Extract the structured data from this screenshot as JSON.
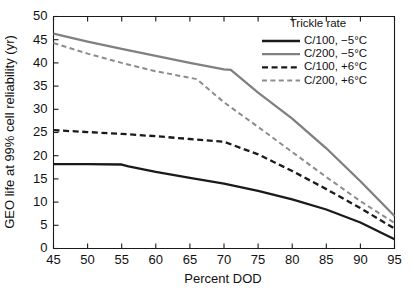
{
  "chart_data": {
    "type": "line",
    "title": "",
    "xlabel": "Percent DOD",
    "ylabel": "GEO life at 99% cell reliability (yr)",
    "xlim": [
      45,
      95
    ],
    "ylim": [
      0,
      50
    ],
    "xticks": [
      45,
      50,
      55,
      60,
      65,
      70,
      75,
      80,
      85,
      90,
      95
    ],
    "yticks": [
      0,
      5,
      10,
      15,
      20,
      25,
      30,
      35,
      40,
      45,
      50
    ],
    "grid": false,
    "legend_position": "upper-right-inside",
    "legend_title": "Trickle rate",
    "series": [
      {
        "name": "C/100, −5°C",
        "color": "#1a1a1a",
        "dash": "solid",
        "width": 2.3,
        "x": [
          45,
          50,
          55,
          56,
          60,
          65,
          70,
          75,
          80,
          85,
          90,
          95
        ],
        "values": [
          18.2,
          18.2,
          18.1,
          17.7,
          16.5,
          15.2,
          14.0,
          12.4,
          10.6,
          8.4,
          5.6,
          2.0
        ]
      },
      {
        "name": "C/200, −5°C",
        "color": "#808080",
        "dash": "solid",
        "width": 2.3,
        "x": [
          45,
          50,
          55,
          60,
          65,
          70,
          71,
          75,
          80,
          85,
          90,
          95
        ],
        "values": [
          46.3,
          44.6,
          43.0,
          41.5,
          40.0,
          38.6,
          38.5,
          33.6,
          28.0,
          21.6,
          14.5,
          7.0
        ]
      },
      {
        "name": "C/100, +6°C",
        "color": "#1a1a1a",
        "dash": "dashed",
        "width": 2.3,
        "x": [
          45,
          50,
          55,
          60,
          65,
          70,
          75,
          80,
          85,
          90,
          95
        ],
        "values": [
          25.5,
          25.1,
          24.7,
          24.2,
          23.6,
          23.0,
          20.3,
          16.7,
          12.8,
          8.7,
          4.3
        ]
      },
      {
        "name": "C/200, +6°C",
        "color": "#8c8c8c",
        "dash": "dashed",
        "width": 2.0,
        "x": [
          45,
          50,
          55,
          60,
          65,
          66,
          70,
          75,
          80,
          85,
          90,
          95
        ],
        "values": [
          44.3,
          42.0,
          40.0,
          38.2,
          36.8,
          36.5,
          31.5,
          26.2,
          20.8,
          15.4,
          10.2,
          5.5
        ]
      }
    ]
  },
  "legend": {
    "title": "Trickle rate",
    "items": [
      {
        "label": "C/100, −5°C"
      },
      {
        "label": "C/200, −5°C"
      },
      {
        "label": "C/100, +6°C"
      },
      {
        "label": "C/200, +6°C"
      }
    ]
  },
  "colors": {
    "axis": "#1a1a1a",
    "black_series": "#1a1a1a",
    "gray_series": "#808080",
    "gray_series_light": "#8c8c8c",
    "background": "#ffffff"
  }
}
